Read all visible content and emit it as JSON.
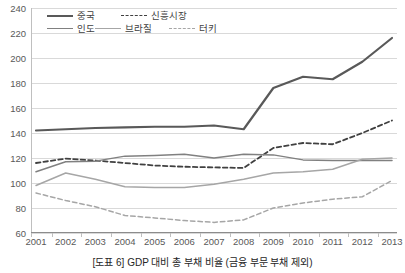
{
  "caption": "[도표 6] GDP 대비 총 부채 비율 (금융 부문 부채 제외)",
  "legend": {
    "items": [
      {
        "label": "중국",
        "style": "solid",
        "color": "#595959",
        "width": 2.2
      },
      {
        "label": "신흥시장",
        "style": "dashed",
        "color": "#404040",
        "width": 1.8
      },
      {
        "label": "인도",
        "style": "solid",
        "color": "#808080",
        "width": 1.5
      },
      {
        "label": "브라질",
        "style": "solid",
        "color": "#a6a6a6",
        "width": 1.5
      },
      {
        "label": "터키",
        "style": "dashed",
        "color": "#a6a6a6",
        "width": 1.5
      }
    ]
  },
  "chart_data": {
    "type": "line",
    "title": "[도표 6] GDP 대비 총 부채 비율 (금융 부문 부채 제외)",
    "xlabel": "",
    "ylabel": "",
    "ylim": [
      60,
      240
    ],
    "ytick_step": 20,
    "yticks": [
      60,
      80,
      100,
      120,
      140,
      160,
      180,
      200,
      220,
      240
    ],
    "grid": true,
    "legend_position": "top-left",
    "categories": [
      2001,
      2002,
      2003,
      2004,
      2005,
      2006,
      2007,
      2008,
      2009,
      2010,
      2011,
      2012,
      2013
    ],
    "x": [
      "2001",
      "2002",
      "2003",
      "2004",
      "2005",
      "2006",
      "2007",
      "2008",
      "2009",
      "2010",
      "2011",
      "2012",
      "2013"
    ],
    "series": [
      {
        "name": "중국",
        "style": "solid",
        "color": "#595959",
        "width": 2.2,
        "values": [
          142,
          143,
          144,
          144.5,
          145,
          145,
          146,
          143,
          176,
          185,
          183,
          197,
          216
        ]
      },
      {
        "name": "신흥시장",
        "style": "dashed",
        "color": "#404040",
        "width": 1.8,
        "values": [
          116,
          119.5,
          118,
          116,
          114,
          113,
          112.5,
          112,
          128,
          132,
          131,
          140,
          150
        ]
      },
      {
        "name": "인도",
        "style": "solid",
        "color": "#808080",
        "width": 1.5,
        "values": [
          109,
          117,
          117.5,
          121.5,
          122,
          123,
          120,
          123,
          122.5,
          118.5,
          118,
          118,
          118
        ]
      },
      {
        "name": "브라질",
        "style": "solid",
        "color": "#a6a6a6",
        "width": 1.5,
        "values": [
          98,
          108,
          103,
          97,
          96.5,
          96.5,
          99,
          103,
          108,
          109,
          111,
          119,
          120
        ]
      },
      {
        "name": "터키",
        "style": "dashed",
        "color": "#a6a6a6",
        "width": 1.5,
        "values": [
          92,
          86,
          81,
          74,
          72,
          70,
          68.5,
          70.5,
          80,
          84,
          87,
          89,
          102
        ]
      }
    ]
  }
}
